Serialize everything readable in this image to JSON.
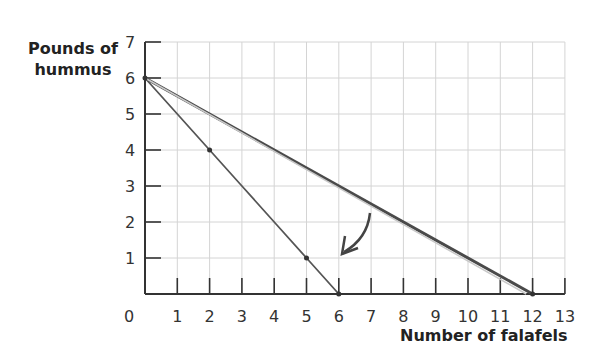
{
  "chart_data": {
    "type": "line",
    "title": "",
    "xlabel": "Number of falafels",
    "ylabel": "Pounds of hummus",
    "xlim": [
      0,
      13
    ],
    "ylim": [
      0,
      7
    ],
    "x_ticks": [
      "0",
      "1",
      "2",
      "3",
      "4",
      "5",
      "6",
      "7",
      "8",
      "9",
      "10",
      "11",
      "12",
      "13"
    ],
    "y_ticks": [
      "1",
      "2",
      "3",
      "4",
      "5",
      "6",
      "7"
    ],
    "grid": true,
    "series": [
      {
        "name": "PPF steep (own production)",
        "color": "#555555",
        "points": [
          [
            0,
            6
          ],
          [
            1,
            5
          ],
          [
            2,
            4
          ],
          [
            3,
            3
          ],
          [
            4,
            2
          ],
          [
            5,
            1
          ],
          [
            6,
            0
          ]
        ]
      },
      {
        "name": "PPF flat (trade)",
        "color": "#4a4a4a",
        "points": [
          [
            0,
            6
          ],
          [
            12,
            0
          ]
        ]
      },
      {
        "name": "Faint line",
        "color": "#c8c8c8",
        "points": [
          [
            0,
            6
          ],
          [
            11.8,
            0
          ]
        ]
      }
    ],
    "annotations": [
      {
        "type": "arrow",
        "from": [
          7,
          2.5
        ],
        "to": [
          6,
          1.1
        ],
        "description": "curved arrow pointing toward steep line endpoint"
      }
    ]
  }
}
